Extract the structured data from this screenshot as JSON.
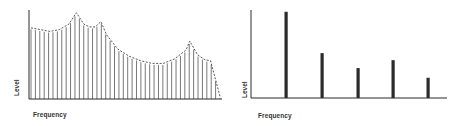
{
  "chart_data": [
    {
      "type": "line",
      "title": "",
      "description": "Continuous spectrum: dense equally spaced vertical lines whose tops follow a dashed envelope with four peaks",
      "xlabel": "Frequency",
      "ylabel": "Level",
      "ylim": [
        0,
        100
      ],
      "grid": false,
      "legend": null,
      "envelope": {
        "x": [
          0,
          5,
          10,
          15,
          20,
          24,
          28,
          31,
          34,
          37,
          40,
          46,
          52,
          58,
          64,
          70,
          76,
          82,
          84,
          88,
          92,
          95,
          100
        ],
        "y": [
          80,
          78,
          76,
          78,
          84,
          97,
          84,
          81,
          81,
          87,
          72,
          56,
          48,
          43,
          40,
          40,
          45,
          55,
          65,
          50,
          44,
          43,
          3
        ]
      },
      "peaks": [
        {
          "x": 24,
          "y": 97
        },
        {
          "x": 31,
          "y": 87
        },
        {
          "x": 67,
          "y": 65
        },
        {
          "x": 84,
          "y": 43
        }
      ],
      "line_count": 44
    },
    {
      "type": "bar",
      "title": "",
      "description": "Line (discrete) spectrum: five isolated vertical bars",
      "xlabel": "Frequency",
      "ylabel": "Level",
      "ylim": [
        0,
        100
      ],
      "grid": false,
      "legend": null,
      "categories": [
        "f1",
        "f2",
        "f3",
        "f4",
        "f5"
      ],
      "values": [
        98,
        51,
        34,
        43,
        23
      ]
    }
  ],
  "left": {
    "xlabel": "Frequency",
    "ylabel": "Level"
  },
  "right": {
    "xlabel": "Frequency",
    "ylabel": "Level"
  },
  "colors": {
    "ink": "#2b2b2b",
    "line": "#555555",
    "background": "#ffffff"
  }
}
